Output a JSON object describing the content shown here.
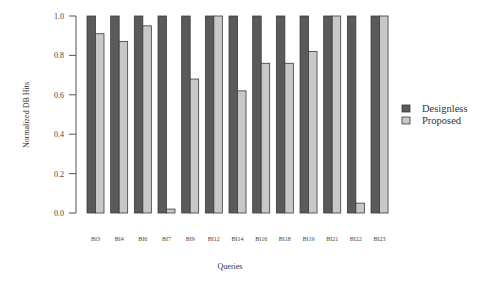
{
  "chart_data": {
    "type": "bar",
    "title": "",
    "xlabel": "Queries",
    "ylabel": "Normalized DB Hits",
    "ylim": [
      0,
      1.0
    ],
    "yticks": [
      0.0,
      0.2,
      0.4,
      0.6,
      0.8,
      1.0
    ],
    "ytick_labels": [
      "0.0",
      "0.2",
      "0.4",
      "0.6",
      "0.8",
      "1.0"
    ],
    "grid": false,
    "legend_position": "right",
    "categories": [
      "BI3",
      "BI4",
      "BI6",
      "BI7",
      "BI9",
      "BI12",
      "BI14",
      "BI16",
      "BI18",
      "BI19",
      "BI21",
      "BI22",
      "BI23"
    ],
    "series": [
      {
        "name": "Designless",
        "color": "#5a5a5a",
        "values": [
          1.0,
          1.0,
          1.0,
          1.0,
          1.0,
          1.0,
          1.0,
          1.0,
          1.0,
          1.0,
          1.0,
          1.0,
          1.0
        ]
      },
      {
        "name": "Proposed",
        "color": "#c8c8c8",
        "values": [
          0.91,
          0.87,
          0.95,
          0.02,
          0.68,
          1.0,
          0.62,
          0.76,
          0.76,
          0.82,
          1.0,
          0.05,
          1.0
        ]
      }
    ]
  }
}
